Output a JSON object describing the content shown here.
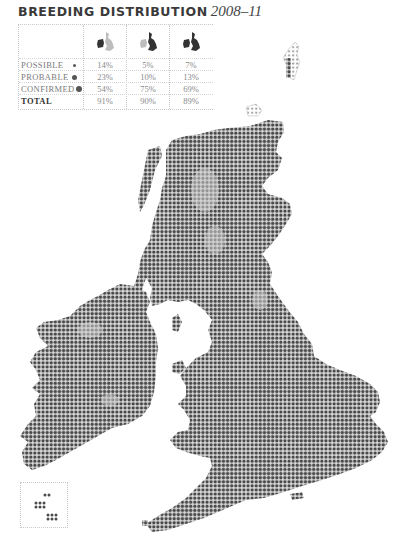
{
  "title": {
    "main": "BREEDING DISTRIBUTION",
    "years": "2008–11"
  },
  "table": {
    "columns": [
      {
        "icon": "map-ireland-highlighted-icon"
      },
      {
        "icon": "map-britain-highlighted-icon"
      },
      {
        "icon": "map-britain-and-ireland-icon"
      }
    ],
    "rows": [
      {
        "label": "POSSIBLE",
        "legend": "small-dot",
        "values": [
          "14%",
          "5%",
          "7%"
        ]
      },
      {
        "label": "PROBABLE",
        "legend": "medium-dot",
        "values": [
          "23%",
          "10%",
          "13%"
        ]
      },
      {
        "label": "CONFIRMED",
        "legend": "large-dot",
        "values": [
          "54%",
          "75%",
          "69%"
        ]
      },
      {
        "label": "TOTAL",
        "legend": "",
        "values": [
          "91%",
          "90%",
          "89%"
        ]
      }
    ]
  },
  "colors": {
    "dot": "#4a4a4a",
    "light": "#bdbdbd",
    "text": "#7a7a7a",
    "title": "#3a3a3a"
  },
  "map": {
    "regions": [
      "Great Britain",
      "Ireland",
      "Isle of Man",
      "Channel Islands inset"
    ]
  }
}
